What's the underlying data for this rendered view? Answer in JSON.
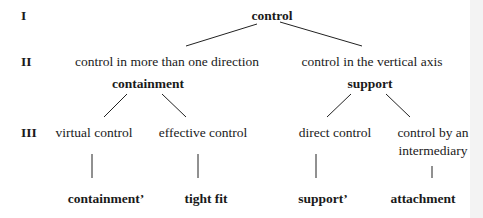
{
  "levels": [
    "I",
    "II",
    "III"
  ],
  "root": {
    "label": "control"
  },
  "level2": [
    {
      "description": "control in more than one direction",
      "term": "containment"
    },
    {
      "description": "control in the vertical axis",
      "term": "support"
    }
  ],
  "level3": [
    {
      "label": "virtual control",
      "leaf": "containment’"
    },
    {
      "label": "effective control",
      "leaf": "tight fit"
    },
    {
      "label": "direct control",
      "leaf": "support’"
    },
    {
      "label_line1": "control by an",
      "label_line2": "intermediary",
      "leaf": "attachment"
    }
  ]
}
